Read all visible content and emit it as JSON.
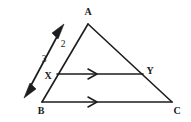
{
  "figure": {
    "type": "euclidean-geometry-diagram",
    "background_color": "#ffffff",
    "stroke_color": "#1d1d1d",
    "label_color": "#1a1a1a",
    "vertices": [
      {
        "id": "A",
        "label": "A",
        "x": 88,
        "y": 24,
        "label_x": 88,
        "label_y": 13
      },
      {
        "id": "B",
        "label": "B",
        "x": 42,
        "y": 102,
        "label_x": 41,
        "label_y": 112
      },
      {
        "id": "C",
        "label": "C",
        "x": 172,
        "y": 102,
        "label_x": 177,
        "label_y": 112
      },
      {
        "id": "X",
        "label": "X",
        "x": 57,
        "y": 74,
        "label_x": 48,
        "label_y": 77
      },
      {
        "id": "Y",
        "label": "Y",
        "x": 143,
        "y": 74,
        "label_x": 150,
        "label_y": 72
      }
    ],
    "segments": [
      {
        "id": "AB",
        "from": "A",
        "to": "B",
        "note": "left side of triangle, passes through X"
      },
      {
        "id": "AC",
        "from": "A",
        "to": "C",
        "note": "right side of triangle, passes through Y"
      },
      {
        "id": "BC",
        "from": "B",
        "to": "C",
        "note": "base of triangle"
      },
      {
        "id": "XY",
        "from": "X",
        "to": "Y",
        "note": "segment parallel to BC"
      }
    ],
    "parallel_marks": [
      {
        "on_segment": "XY",
        "x": 93,
        "y": 74,
        "count": 1,
        "direction": "right"
      },
      {
        "on_segment": "BC",
        "x": 93,
        "y": 102,
        "count": 1,
        "direction": "right"
      }
    ],
    "direction_arrow": {
      "id": "double-headed-arrow",
      "note": "double headed arrow drawn parallel to side AB, outside the triangle",
      "tail_x": 24,
      "tail_y": 98,
      "head_x": 64,
      "head_y": 24,
      "double_headed": true
    },
    "measure_labels": [
      {
        "id": "label-2",
        "text": "2",
        "x": 63,
        "y": 45,
        "on_segment": "AX"
      },
      {
        "id": "label-3",
        "text": "3",
        "x": 44,
        "y": 60,
        "near": "double-headed-arrow"
      }
    ]
  }
}
